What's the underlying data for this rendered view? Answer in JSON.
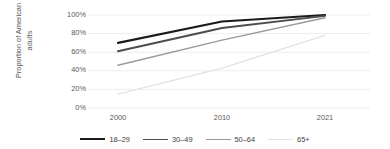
{
  "chart_data": {
    "type": "line",
    "title": "",
    "xlabel": "",
    "ylabel": "Proportion of American adults",
    "ylabel_lines": [
      "Proportion of American",
      "adults"
    ],
    "categories": [
      "2000",
      "2010",
      "2021"
    ],
    "x_tick_labels": [
      "2000",
      "2010",
      "2021"
    ],
    "y_tick_labels": [
      "100%",
      "80%",
      "60%",
      "40%",
      "20%",
      "0%"
    ],
    "y_ticks": [
      100,
      80,
      60,
      40,
      20,
      0
    ],
    "ylim": [
      0,
      100
    ],
    "y_unit": "%",
    "grid": "horizontal",
    "legend_position": "bottom",
    "series": [
      {
        "name": "18–29",
        "values": [
          70,
          93,
          100
        ],
        "color": "#1a1a1a",
        "width": 2.2
      },
      {
        "name": "30–49",
        "values": [
          61,
          86,
          99
        ],
        "color": "#4d4d4d",
        "width": 1.9
      },
      {
        "name": "50–64",
        "values": [
          46,
          73,
          97
        ],
        "color": "#9a9a9a",
        "width": 1.5
      },
      {
        "name": "65+",
        "values": [
          15,
          43,
          78
        ],
        "color": "#e2e2e2",
        "width": 1.3
      }
    ]
  },
  "colors": {
    "background": "#ffffff",
    "gridline": "#ededed",
    "tick_text": "#595959",
    "legend_text": "#404040",
    "series_18_29": "#1a1a1a",
    "series_30_49": "#4d4d4d",
    "series_50_64": "#9a9a9a",
    "series_65_plus": "#e2e2e2"
  },
  "legend": {
    "items": [
      {
        "label": "18–29"
      },
      {
        "label": "30–49"
      },
      {
        "label": "50–64"
      },
      {
        "label": "65+"
      }
    ]
  }
}
